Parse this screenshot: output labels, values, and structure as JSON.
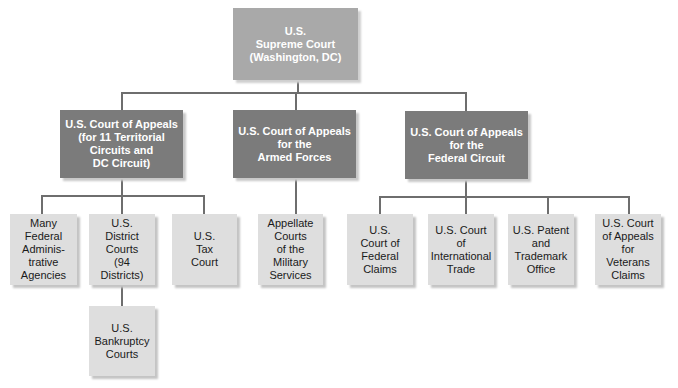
{
  "diagram": {
    "root": {
      "label": "U.S.\nSupreme Court\n(Washington, DC)"
    },
    "appeals": [
      {
        "label": "U.S. Court of Appeals\n(for 11 Territorial\nCircuits and\nDC Circuit)"
      },
      {
        "label": "U.S. Court of Appeals\nfor the\nArmed Forces"
      },
      {
        "label": "U.S. Court of Appeals\nfor the\nFederal Circuit"
      }
    ],
    "lower": [
      {
        "label": "Many\nFederal\nAdminis-\ntrative\nAgencies",
        "parent": 0
      },
      {
        "label": "U.S.\nDistrict\nCourts\n(94\nDistricts)",
        "parent": 0
      },
      {
        "label": "U.S.\nTax\nCourt",
        "parent": 0
      },
      {
        "label": "Appellate\nCourts\nof the\nMilitary\nServices",
        "parent": 1
      },
      {
        "label": "U.S.\nCourt of\nFederal\nClaims",
        "parent": 2
      },
      {
        "label": "U.S. Court\nof\nInternational\nTrade",
        "parent": 2
      },
      {
        "label": "U.S. Patent\nand\nTrademark\nOffice",
        "parent": 2
      },
      {
        "label": "U.S. Court\nof Appeals\nfor\nVeterans\nClaims",
        "parent": 2
      }
    ],
    "bankruptcy": {
      "label": "U.S.\nBankruptcy\nCourts",
      "parent": "district"
    },
    "colors": {
      "root": "#a9a9a9",
      "appeals": "#7b7b7b",
      "lower": "#dedede",
      "connector": "#6e6e6e"
    }
  }
}
